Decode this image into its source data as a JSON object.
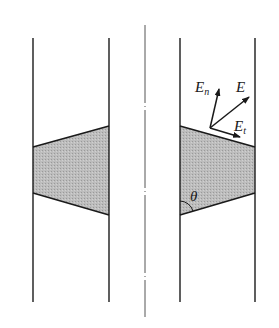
{
  "diagram": {
    "labels": {
      "E": "E",
      "En_main": "E",
      "En_sub": "n",
      "Et_main": "E",
      "Et_sub": "t",
      "theta": "θ"
    },
    "colors": {
      "line": "#1a1a1a",
      "fill": "#b8b8b8",
      "axis": "#555555",
      "background": "#ffffff"
    },
    "elements": [
      "left-outer-wall",
      "left-inner-wall",
      "center-axis (dash-dot)",
      "right-inner-wall",
      "right-outer-wall",
      "left-insulator-section (trapezoid)",
      "right-insulator-section (trapezoid)",
      "field-vector-E",
      "normal-component-En",
      "tangential-component-Et",
      "angle-theta-arc"
    ]
  }
}
